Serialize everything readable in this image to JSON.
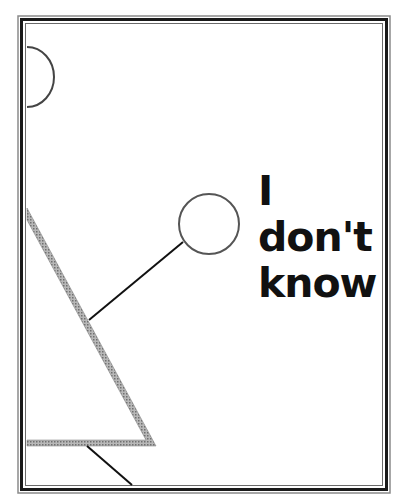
{
  "caption": {
    "line1": "I don't",
    "line2": "know"
  },
  "colors": {
    "frame": "#1a1a1a",
    "frame_outer": "#8a8a8a",
    "shape_fill": "#9a9a9a",
    "stroke": "#111111",
    "background": "#ffffff"
  }
}
